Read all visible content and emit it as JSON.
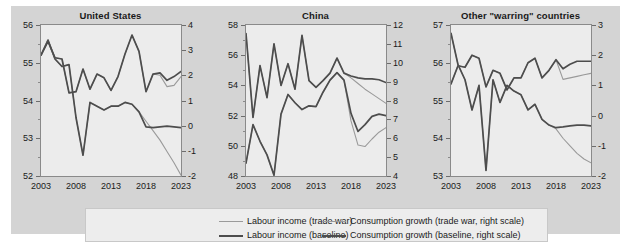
{
  "figure": {
    "background": "#d4d4d4",
    "plot_background": "#ececec"
  },
  "colors": {
    "trade_war": "#9a9a9a",
    "baseline": "#4d4d4d",
    "axis": "#8a8a8a",
    "text": "#1a1a1a"
  },
  "legend": {
    "items": [
      {
        "label": "Labour income (trade war)",
        "color": "#9a9a9a",
        "width": 1.4
      },
      {
        "label": "Labour income (baseline)",
        "color": "#4d4d4d",
        "width": 2.2
      },
      {
        "label": "Consumption growth (trade war, right scale)",
        "color": "#9a9a9a",
        "width": 1.4
      },
      {
        "label": "Consumption growth (baseline, right scale)",
        "color": "#4d4d4d",
        "width": 2.2
      }
    ]
  },
  "chart_data": [
    {
      "type": "line",
      "title": "United States",
      "xlabel": "",
      "ylabel": "",
      "xlim": [
        2003,
        2023
      ],
      "ylim": [
        52,
        56
      ],
      "ylim_right": [
        -2,
        4
      ],
      "yticks": [
        52,
        53,
        54,
        55,
        56
      ],
      "yticks_right": [
        -2,
        -1,
        0,
        1,
        2,
        3,
        4
      ],
      "xticks": [
        2003,
        2008,
        2013,
        2018,
        2023
      ],
      "grid": false,
      "legend_position": "below-figure",
      "x": [
        2003,
        2004,
        2005,
        2006,
        2007,
        2008,
        2009,
        2010,
        2011,
        2012,
        2013,
        2014,
        2015,
        2016,
        2017,
        2018,
        2019,
        2020,
        2021,
        2022,
        2023
      ],
      "series": [
        {
          "name": "Labour income (trade war)",
          "axis": "left",
          "color": "#9a9a9a",
          "values": [
            55.2,
            55.6,
            55.1,
            54.9,
            54.95,
            53.55,
            52.55,
            53.95,
            53.85,
            53.75,
            53.85,
            53.85,
            53.95,
            53.9,
            53.7,
            53.45,
            53.2,
            52.95,
            52.65,
            52.35,
            52.02
          ]
        },
        {
          "name": "Labour income (baseline)",
          "axis": "left",
          "color": "#4d4d4d",
          "values": [
            55.2,
            55.6,
            55.1,
            54.9,
            54.95,
            53.55,
            52.55,
            53.95,
            53.85,
            53.75,
            53.85,
            53.85,
            53.95,
            53.9,
            53.7,
            53.3,
            53.28,
            53.3,
            53.32,
            53.3,
            53.28
          ]
        },
        {
          "name": "Consumption growth (trade war, right scale)",
          "axis": "right",
          "color": "#9a9a9a",
          "values": [
            2.8,
            3.35,
            2.7,
            2.65,
            1.3,
            1.35,
            2.25,
            1.45,
            2.05,
            1.9,
            1.4,
            1.95,
            2.85,
            3.6,
            2.95,
            1.35,
            2.05,
            2.0,
            1.55,
            1.6,
            1.95
          ]
        },
        {
          "name": "Consumption growth (baseline, right scale)",
          "axis": "right",
          "color": "#4d4d4d",
          "values": [
            2.8,
            3.35,
            2.7,
            2.65,
            1.3,
            1.35,
            2.25,
            1.45,
            2.05,
            1.9,
            1.4,
            1.95,
            2.85,
            3.6,
            2.95,
            1.35,
            2.05,
            2.1,
            1.8,
            1.95,
            2.15
          ]
        }
      ]
    },
    {
      "type": "line",
      "title": "China",
      "xlabel": "",
      "ylabel": "",
      "xlim": [
        2003,
        2023
      ],
      "ylim": [
        48,
        58
      ],
      "ylim_right": [
        4,
        12
      ],
      "yticks": [
        48,
        50,
        52,
        54,
        56,
        58
      ],
      "yticks_right": [
        4,
        5,
        6,
        7,
        8,
        9,
        10,
        11,
        12
      ],
      "xticks": [
        2003,
        2008,
        2013,
        2018,
        2023
      ],
      "grid": false,
      "legend_position": "below-figure",
      "x": [
        2003,
        2004,
        2005,
        2006,
        2007,
        2008,
        2009,
        2010,
        2011,
        2012,
        2013,
        2014,
        2015,
        2016,
        2017,
        2018,
        2019,
        2020,
        2021,
        2022,
        2023
      ],
      "series": [
        {
          "name": "Labour income (trade war)",
          "axis": "left",
          "color": "#9a9a9a",
          "values": [
            48.85,
            51.4,
            50.3,
            49.4,
            48.05,
            52.1,
            53.4,
            52.85,
            52.4,
            52.65,
            52.6,
            53.55,
            54.35,
            54.85,
            54.35,
            51.65,
            50.05,
            49.95,
            50.45,
            50.9,
            51.2
          ]
        },
        {
          "name": "Labour income (baseline)",
          "axis": "left",
          "color": "#4d4d4d",
          "values": [
            48.85,
            51.4,
            50.3,
            49.4,
            48.05,
            52.1,
            53.4,
            52.85,
            52.4,
            52.65,
            52.6,
            53.55,
            54.35,
            54.85,
            54.35,
            52.15,
            50.95,
            51.4,
            51.95,
            52.1,
            52.0
          ]
        },
        {
          "name": "Consumption growth (trade war, right scale)",
          "axis": "right",
          "color": "#9a9a9a",
          "values": [
            11.55,
            7.1,
            9.85,
            8.15,
            11.0,
            8.8,
            9.95,
            8.6,
            11.45,
            9.05,
            8.7,
            9.05,
            9.45,
            10.25,
            9.45,
            9.2,
            8.9,
            8.6,
            8.35,
            8.1,
            7.85
          ]
        },
        {
          "name": "Consumption growth (baseline, right scale)",
          "axis": "right",
          "color": "#4d4d4d",
          "values": [
            11.55,
            7.1,
            9.85,
            8.15,
            11.0,
            8.8,
            9.95,
            8.6,
            11.45,
            9.05,
            8.7,
            9.05,
            9.45,
            10.25,
            9.45,
            9.3,
            9.2,
            9.15,
            9.15,
            9.1,
            8.95
          ]
        }
      ]
    },
    {
      "type": "line",
      "title": "Other \"warring\" countries",
      "xlabel": "",
      "ylabel": "",
      "xlim": [
        2003,
        2023
      ],
      "ylim": [
        53,
        57
      ],
      "ylim_right": [
        -2,
        3
      ],
      "yticks": [
        53,
        54,
        55,
        56,
        57
      ],
      "yticks_right": [
        -2,
        -1,
        0,
        1,
        2,
        3
      ],
      "xticks": [
        2003,
        2008,
        2013,
        2018,
        2023
      ],
      "grid": false,
      "legend_position": "below-figure",
      "x": [
        2003,
        2004,
        2005,
        2006,
        2007,
        2008,
        2009,
        2010,
        2011,
        2012,
        2013,
        2014,
        2015,
        2016,
        2017,
        2018,
        2019,
        2020,
        2021,
        2022,
        2023
      ],
      "series": [
        {
          "name": "Labour income (trade war)",
          "axis": "left",
          "color": "#9a9a9a",
          "values": [
            56.78,
            55.95,
            55.55,
            54.75,
            55.4,
            53.15,
            55.55,
            54.95,
            55.4,
            55.25,
            55.15,
            54.75,
            54.9,
            54.5,
            54.35,
            54.25,
            54.0,
            53.8,
            53.6,
            53.45,
            53.35
          ]
        },
        {
          "name": "Labour income (baseline)",
          "axis": "left",
          "color": "#4d4d4d",
          "values": [
            56.78,
            55.95,
            55.55,
            54.75,
            55.4,
            53.15,
            55.55,
            54.95,
            55.4,
            55.25,
            55.15,
            54.75,
            54.9,
            54.5,
            54.35,
            54.28,
            54.3,
            54.33,
            54.35,
            54.35,
            54.33
          ]
        },
        {
          "name": "Consumption growth (trade war, right scale)",
          "axis": "right",
          "color": "#9a9a9a",
          "values": [
            1.05,
            1.65,
            1.6,
            2.0,
            1.9,
            0.95,
            1.5,
            1.4,
            0.85,
            1.25,
            1.25,
            1.75,
            1.9,
            1.25,
            1.5,
            1.85,
            1.2,
            1.25,
            1.3,
            1.35,
            1.4
          ]
        },
        {
          "name": "Consumption growth (baseline, right scale)",
          "axis": "right",
          "color": "#4d4d4d",
          "values": [
            1.05,
            1.65,
            1.6,
            2.0,
            1.9,
            0.95,
            1.5,
            1.4,
            0.85,
            1.25,
            1.25,
            1.75,
            1.9,
            1.25,
            1.5,
            1.85,
            1.55,
            1.7,
            1.8,
            1.8,
            1.8
          ]
        }
      ]
    }
  ]
}
